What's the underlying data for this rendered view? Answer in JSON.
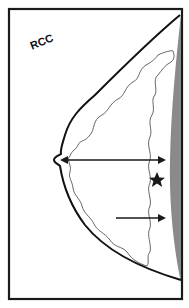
{
  "diagram": {
    "view_label": "RCC",
    "colors": {
      "frame": "#1a1a1a",
      "outline": "#111111",
      "tissue_line": "#555555",
      "chest_wall": "#8a8a8a",
      "arrow": "#1a1a1a",
      "marker": "#1a1a1a"
    },
    "elements": {
      "arrows": [
        {
          "name": "nipple-to-chest-wall-arrow",
          "type": "double-headed"
        },
        {
          "name": "lower-arrow",
          "type": "single-headed"
        }
      ],
      "marker": {
        "name": "star-marker",
        "shape": "star"
      }
    }
  }
}
